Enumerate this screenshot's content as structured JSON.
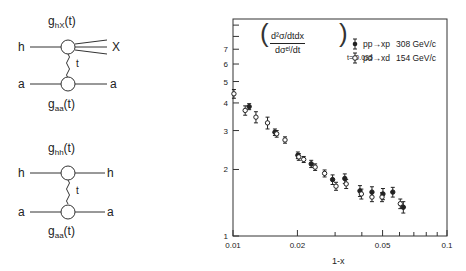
{
  "diagrams": [
    {
      "id": "inclusive",
      "top_coupling": "g",
      "top_coupling_sub": "hX",
      "top_coupling_arg": "(t)",
      "bottom_coupling": "g",
      "bottom_coupling_sub": "aa",
      "bottom_coupling_arg": "(t)",
      "left_top": "h",
      "right_top": "X",
      "left_bottom": "a",
      "right_bottom": "a",
      "exchange": "t"
    },
    {
      "id": "elastic",
      "top_coupling": "g",
      "top_coupling_sub": "hh",
      "top_coupling_arg": "(t)",
      "bottom_coupling": "g",
      "bottom_coupling_sub": "aa",
      "bottom_coupling_arg": "(t)",
      "left_top": "h",
      "right_top": "h",
      "left_bottom": "a",
      "right_bottom": "a",
      "exchange": "t"
    }
  ],
  "formula": {
    "numerator": "d²σ/dtdx",
    "denominator": "dσᵉˡ/dt",
    "subscript": "t=-0.035"
  },
  "legend": [
    {
      "marker": "filled-circle",
      "reaction": "pp→xp",
      "energy": "308 GeV/c"
    },
    {
      "marker": "open-circle",
      "reaction": "pd→xd",
      "energy": "154 GeV/c"
    }
  ],
  "chart_data": {
    "type": "scatter",
    "title": "",
    "xlabel": "1-x",
    "ylabel": "(d²σ/dtdx)/(dσel/dt) at t=-0.035",
    "xscale": "log",
    "yscale": "log",
    "xlim": [
      0.01,
      0.1
    ],
    "ylim": [
      1,
      10
    ],
    "x_ticks": [
      0.01,
      0.02,
      0.05,
      0.1
    ],
    "x_tick_labels": [
      "0.01",
      "0.02",
      "0.05",
      "0.1"
    ],
    "y_ticks": [
      1,
      2,
      3,
      4,
      5,
      6,
      7
    ],
    "y_tick_labels": [
      "1",
      "2",
      "3",
      "4",
      "5",
      "6",
      "7"
    ],
    "grid": false,
    "legend_position": "upper right",
    "series": [
      {
        "name": "pp→xp 308 GeV/c",
        "marker": "filled-circle",
        "points": [
          {
            "x": 0.0119,
            "y": 3.85,
            "err": 0.12
          },
          {
            "x": 0.0157,
            "y": 2.95,
            "err": 0.1
          },
          {
            "x": 0.0201,
            "y": 2.32,
            "err": 0.08
          },
          {
            "x": 0.0232,
            "y": 2.12,
            "err": 0.08
          },
          {
            "x": 0.0292,
            "y": 1.8,
            "err": 0.09
          },
          {
            "x": 0.0333,
            "y": 1.82,
            "err": 0.09
          },
          {
            "x": 0.0392,
            "y": 1.6,
            "err": 0.09
          },
          {
            "x": 0.0446,
            "y": 1.58,
            "err": 0.09
          },
          {
            "x": 0.0502,
            "y": 1.55,
            "err": 0.09
          },
          {
            "x": 0.0558,
            "y": 1.58,
            "err": 0.08
          },
          {
            "x": 0.0625,
            "y": 1.35,
            "err": 0.08
          }
        ]
      },
      {
        "name": "pd→xd 154 GeV/c",
        "marker": "open-circle",
        "points": [
          {
            "x": 0.0101,
            "y": 4.4,
            "err": 0.2
          },
          {
            "x": 0.0114,
            "y": 3.7,
            "err": 0.18
          },
          {
            "x": 0.0128,
            "y": 3.45,
            "err": 0.2
          },
          {
            "x": 0.0145,
            "y": 3.25,
            "err": 0.2
          },
          {
            "x": 0.016,
            "y": 2.9,
            "err": 0.1
          },
          {
            "x": 0.0175,
            "y": 2.72,
            "err": 0.09
          },
          {
            "x": 0.0203,
            "y": 2.28,
            "err": 0.08
          },
          {
            "x": 0.0214,
            "y": 2.22,
            "err": 0.07
          },
          {
            "x": 0.0242,
            "y": 2.05,
            "err": 0.07
          },
          {
            "x": 0.0268,
            "y": 1.92,
            "err": 0.07
          },
          {
            "x": 0.0303,
            "y": 1.68,
            "err": 0.07
          },
          {
            "x": 0.0338,
            "y": 1.72,
            "err": 0.08
          },
          {
            "x": 0.0398,
            "y": 1.55,
            "err": 0.08
          },
          {
            "x": 0.0446,
            "y": 1.5,
            "err": 0.07
          },
          {
            "x": 0.0497,
            "y": 1.5,
            "err": 0.07
          },
          {
            "x": 0.0605,
            "y": 1.4,
            "err": 0.07
          }
        ]
      }
    ]
  }
}
